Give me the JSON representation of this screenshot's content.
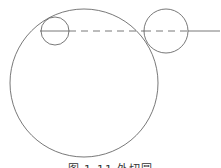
{
  "diagram": {
    "caption": "图 1-11 外切圆",
    "stroke_color": "#555555",
    "big_circle": {
      "cx": 84,
      "cy": 83,
      "r": 74
    },
    "small_circle": {
      "cx": 55,
      "cy": 31,
      "r": 14
    },
    "right_circle": {
      "cx": 166,
      "cy": 31,
      "r": 22
    },
    "center_line": {
      "y": 31,
      "x_start": 40,
      "x_end": 220
    }
  }
}
